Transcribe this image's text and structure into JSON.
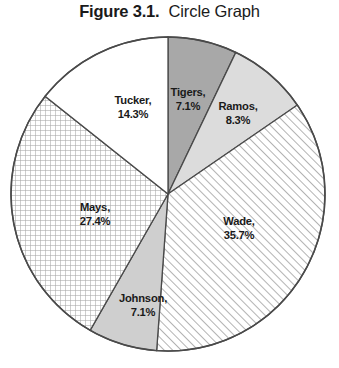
{
  "figure": {
    "label": "Figure 3.1.",
    "caption": "Circle Graph"
  },
  "chart_data": {
    "type": "pie",
    "title": "Circle Graph",
    "figure_label": "Figure 3.1.",
    "xlabel": "",
    "ylabel": "",
    "legend": "none",
    "labels_inside_slices": true,
    "start_angle_deg": 0,
    "direction": "clockwise",
    "categories": [
      "Tigers",
      "Ramos",
      "Wade",
      "Johnson",
      "Mays",
      "Tucker"
    ],
    "values": [
      7.1,
      8.3,
      35.7,
      7.1,
      27.4,
      14.3
    ],
    "unit": "%",
    "slices": [
      {
        "name": "Tigers",
        "value": 7.1,
        "label": "Tigers,",
        "value_label": "7.1%",
        "fill": "#a8a8a8",
        "pattern": "solid-dark-gray",
        "label_x": 188,
        "label_y": 96
      },
      {
        "name": "Ramos",
        "value": 8.3,
        "label": "Ramos,",
        "value_label": "8.3%",
        "fill": "#dcdcdc",
        "pattern": "solid-light-gray",
        "label_x": 238,
        "label_y": 110
      },
      {
        "name": "Wade",
        "value": 35.7,
        "label": "Wade,",
        "value_label": "35.7%",
        "fill": "#ffffff",
        "pattern": "diagonal-hatch",
        "label_x": 239,
        "label_y": 225
      },
      {
        "name": "Johnson",
        "value": 7.1,
        "label": "Johnson,",
        "value_label": "7.1%",
        "fill": "#cfcfcf",
        "pattern": "solid-medium-gray",
        "label_x": 143,
        "label_y": 302
      },
      {
        "name": "Mays",
        "value": 27.4,
        "label": "Mays,",
        "value_label": "27.4%",
        "fill": "#ffffff",
        "pattern": "cross-hatch-grid",
        "label_x": 95,
        "label_y": 211
      },
      {
        "name": "Tucker",
        "value": 14.3,
        "label": "Tucker,",
        "value_label": "14.3%",
        "fill": "#ffffff",
        "pattern": "none-white",
        "label_x": 133,
        "label_y": 104
      }
    ],
    "geometry": {
      "center_x": 168,
      "center_y": 194,
      "radius": 157
    },
    "colors": {
      "outline": "#4a4a4a",
      "text": "#1a1a1a",
      "background": "#ffffff"
    }
  }
}
